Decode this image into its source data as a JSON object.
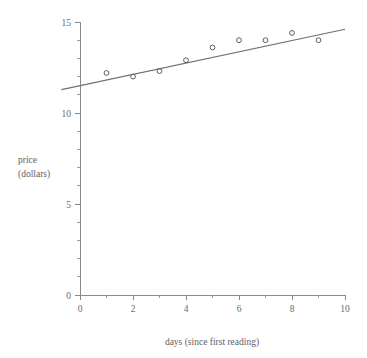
{
  "chart_data": {
    "type": "scatter",
    "title": "",
    "xlabel": "days (since first reading)",
    "ylabel": "price\n(dollars)",
    "ylabel_line1": "price",
    "ylabel_line2": "(dollars)",
    "x": [
      1,
      2,
      3,
      4,
      5,
      6,
      7,
      8,
      9
    ],
    "values": [
      12.2,
      12.0,
      12.3,
      12.9,
      13.6,
      14.0,
      14.0,
      14.4,
      14.0
    ],
    "series": [
      {
        "name": "price readings",
        "x": [
          1,
          2,
          3,
          4,
          5,
          6,
          7,
          8,
          9
        ],
        "values": [
          12.2,
          12.0,
          12.3,
          12.9,
          13.6,
          14.0,
          14.0,
          14.4,
          14.0
        ]
      },
      {
        "name": "least-squares regression line",
        "type": "line",
        "slope": 0.31,
        "intercept": 11.5,
        "x_endpoints": [
          -0.7,
          10.0
        ],
        "y_endpoints": [
          11.28,
          14.6
        ]
      }
    ],
    "xlim": [
      0,
      10
    ],
    "ylim": [
      0,
      15
    ],
    "xticks": [
      0,
      2,
      4,
      6,
      8,
      10
    ],
    "xtick_labels": [
      "0",
      "2",
      "4",
      "6",
      "8",
      "10"
    ],
    "x_minor_step": 1,
    "yticks": [
      0,
      5,
      10,
      15
    ],
    "ytick_labels": [
      "0",
      "5",
      "10",
      "15"
    ],
    "y_minor_step": 1,
    "grid": false,
    "legend": "none",
    "marker": "open-circle",
    "colors": {
      "axis": "#8a8a8a",
      "marker": "#5d5d5d",
      "fit_line": "#6f6f6f",
      "text": "#5e5e5e",
      "background": "#ffffff"
    }
  }
}
